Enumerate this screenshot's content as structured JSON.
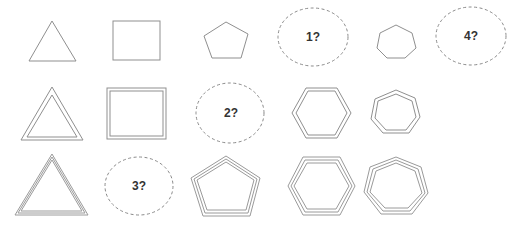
{
  "puzzle": {
    "description": "Shape matrix puzzle: rows increase outline line count (1, 2, 3), columns increase polygon side count (3 to 7).",
    "colors": {
      "stroke": "#8f8f8f",
      "placeholder_stroke": "#8a8a8a",
      "label": "#333333",
      "background": "#ffffff"
    },
    "rows": [
      {
        "row": 1,
        "line_count": 1,
        "cells": [
          {
            "type": "shape",
            "shape": "triangle",
            "sides": 3
          },
          {
            "type": "shape",
            "shape": "square",
            "sides": 4
          },
          {
            "type": "shape",
            "shape": "pentagon",
            "sides": 5
          },
          {
            "type": "placeholder",
            "label": "1?"
          },
          {
            "type": "shape",
            "shape": "heptagon",
            "sides": 7
          },
          {
            "type": "placeholder",
            "label": "4?"
          }
        ]
      },
      {
        "row": 2,
        "line_count": 2,
        "cells": [
          {
            "type": "shape",
            "shape": "triangle",
            "sides": 3
          },
          {
            "type": "shape",
            "shape": "square",
            "sides": 4
          },
          {
            "type": "placeholder",
            "label": "2?"
          },
          {
            "type": "shape",
            "shape": "hexagon",
            "sides": 6
          },
          {
            "type": "shape",
            "shape": "heptagon",
            "sides": 7
          }
        ]
      },
      {
        "row": 3,
        "line_count": 3,
        "cells": [
          {
            "type": "shape",
            "shape": "triangle",
            "sides": 3
          },
          {
            "type": "placeholder",
            "label": "3?"
          },
          {
            "type": "shape",
            "shape": "pentagon",
            "sides": 5
          },
          {
            "type": "shape",
            "shape": "hexagon",
            "sides": 6
          },
          {
            "type": "shape",
            "shape": "heptagon",
            "sides": 7
          }
        ]
      }
    ],
    "placeholders": {
      "p1": "1?",
      "p2": "2?",
      "p3": "3?",
      "p4": "4?"
    }
  }
}
